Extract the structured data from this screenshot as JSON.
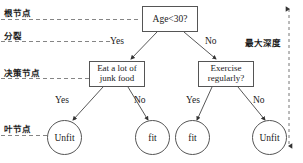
{
  "diagram": {
    "type": "decision-tree",
    "title": "",
    "nodes": {
      "root": {
        "label": "Age<30?"
      },
      "decision_left": {
        "line1": "Eat a lot of",
        "line2": "junk food"
      },
      "decision_right": {
        "line1": "Exercise",
        "line2": "regularly?"
      },
      "leaf_1": {
        "label": "Unfit"
      },
      "leaf_2": {
        "label": "fit"
      },
      "leaf_3": {
        "label": "fit"
      },
      "leaf_4": {
        "label": "Unfit"
      }
    },
    "edge_labels": {
      "root_yes": "Yes",
      "root_no": "No",
      "left_yes": "Yes",
      "left_no": "No",
      "right_yes": "Yes",
      "right_no": "No"
    },
    "annotations": {
      "root_node": "根节点",
      "split": "分裂",
      "decision_node": "决策节点",
      "leaf_node": "叶节点",
      "max_depth": "最大深度"
    },
    "colors": {
      "stroke": "#555555",
      "text": "#1a1a1a",
      "background": "#ffffff",
      "dashed": "#777777"
    }
  }
}
